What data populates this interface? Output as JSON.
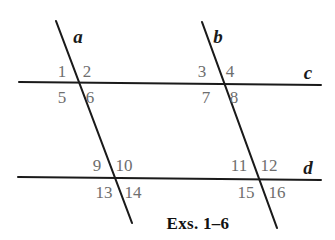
{
  "figure": {
    "caption": "Exs. 1–6",
    "caption_pos": {
      "x": 198,
      "y": 223
    },
    "background_color": "#ffffff",
    "line_color": "#1a1a1a",
    "label_color": "#6e6e6e",
    "line_name_color": "#1a1a1a",
    "lines": [
      {
        "name": "a",
        "role": "transversal",
        "label": "a",
        "label_pos": {
          "x": 78,
          "y": 36
        },
        "x1": 56,
        "y1": 21,
        "x2": 132,
        "y2": 223,
        "stroke_width": 2.1
      },
      {
        "name": "b",
        "role": "transversal",
        "label": "b",
        "label_pos": {
          "x": 218,
          "y": 36
        },
        "x1": 202,
        "y1": 22,
        "x2": 277,
        "y2": 228,
        "stroke_width": 2.1
      },
      {
        "name": "c",
        "role": "horizontal",
        "label": "c",
        "label_pos": {
          "x": 308,
          "y": 72
        },
        "x1": 19,
        "y1": 82,
        "x2": 321,
        "y2": 85,
        "stroke_width": 2.0
      },
      {
        "name": "d",
        "role": "horizontal",
        "label": "d",
        "label_pos": {
          "x": 308,
          "y": 167
        },
        "x1": 18,
        "y1": 177,
        "x2": 321,
        "y2": 180,
        "stroke_width": 2.0
      }
    ],
    "intersections": [
      {
        "name": "a-c",
        "x": 78,
        "y": 83
      },
      {
        "name": "b-c",
        "x": 222,
        "y": 84
      },
      {
        "name": "a-d",
        "x": 113,
        "y": 178
      },
      {
        "name": "b-d",
        "x": 257,
        "y": 179
      }
    ],
    "angle_labels": [
      {
        "id": 1,
        "text": "1",
        "x": 62,
        "y": 71,
        "at": "a-c",
        "quadrant": "upper-left"
      },
      {
        "id": 2,
        "text": "2",
        "x": 87,
        "y": 71,
        "at": "a-c",
        "quadrant": "upper-right"
      },
      {
        "id": 3,
        "text": "3",
        "x": 202,
        "y": 71,
        "at": "b-c",
        "quadrant": "upper-left"
      },
      {
        "id": 4,
        "text": "4",
        "x": 230,
        "y": 71,
        "at": "b-c",
        "quadrant": "upper-right"
      },
      {
        "id": 5,
        "text": "5",
        "x": 62,
        "y": 97,
        "at": "a-c",
        "quadrant": "lower-left"
      },
      {
        "id": 6,
        "text": "6",
        "x": 90,
        "y": 97,
        "at": "a-c",
        "quadrant": "lower-right"
      },
      {
        "id": 7,
        "text": "7",
        "x": 206,
        "y": 97,
        "at": "b-c",
        "quadrant": "lower-left"
      },
      {
        "id": 8,
        "text": "8",
        "x": 234,
        "y": 97,
        "at": "b-c",
        "quadrant": "lower-right"
      },
      {
        "id": 9,
        "text": "9",
        "x": 97,
        "y": 165,
        "at": "a-d",
        "quadrant": "upper-left"
      },
      {
        "id": 10,
        "text": "10",
        "x": 124,
        "y": 165,
        "at": "a-d",
        "quadrant": "upper-right"
      },
      {
        "id": 11,
        "text": "11",
        "x": 239,
        "y": 165,
        "at": "b-d",
        "quadrant": "upper-left"
      },
      {
        "id": 12,
        "text": "12",
        "x": 269,
        "y": 165,
        "at": "b-d",
        "quadrant": "upper-right"
      },
      {
        "id": 13,
        "text": "13",
        "x": 104,
        "y": 192,
        "at": "a-d",
        "quadrant": "lower-left"
      },
      {
        "id": 14,
        "text": "14",
        "x": 133,
        "y": 192,
        "at": "a-d",
        "quadrant": "lower-right"
      },
      {
        "id": 15,
        "text": "15",
        "x": 246,
        "y": 192,
        "at": "b-d",
        "quadrant": "lower-left"
      },
      {
        "id": 16,
        "text": "16",
        "x": 277,
        "y": 192,
        "at": "b-d",
        "quadrant": "lower-right"
      }
    ]
  }
}
